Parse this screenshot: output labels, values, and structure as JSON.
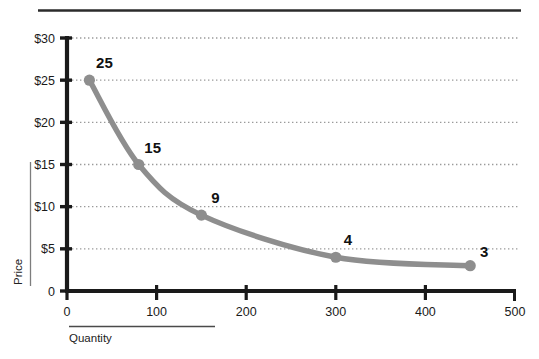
{
  "chart_data": {
    "type": "line",
    "title": "",
    "subtitle": "",
    "xlabel": "Quantity",
    "ylabel": "Price",
    "x": [
      25,
      80,
      150,
      300,
      450
    ],
    "values": [
      25,
      15,
      9,
      4,
      3
    ],
    "point_labels": [
      "25",
      "15",
      "9",
      "4",
      "3"
    ],
    "xlim": [
      0,
      500
    ],
    "ylim": [
      0,
      30
    ],
    "xticks": [
      "0",
      "100",
      "200",
      "300",
      "400",
      "500"
    ],
    "xtick_values": [
      0,
      100,
      200,
      300,
      400,
      500
    ],
    "yticks": [
      "0",
      "$5",
      "$10",
      "$15",
      "$20",
      "$25",
      "$30"
    ],
    "ytick_values": [
      0,
      5,
      10,
      15,
      20,
      25,
      30
    ],
    "grid": "horizontal-dotted",
    "legend": "none",
    "series_color": "#8e8e8e",
    "axis_color": "#1a1a1a",
    "grid_color": "#9a9a9a"
  },
  "colors": {
    "curve": "#8e8e8e",
    "marker": "#8e8e8e",
    "axis": "#1a1a1a",
    "grid": "#9a9a9a",
    "rule": "#2b2b2b",
    "label_text": "#111111",
    "tick_text": "#1a1a1a"
  },
  "decorations": {
    "top_rule": true,
    "ylabel_rule": true,
    "xlabel_rule": true
  }
}
